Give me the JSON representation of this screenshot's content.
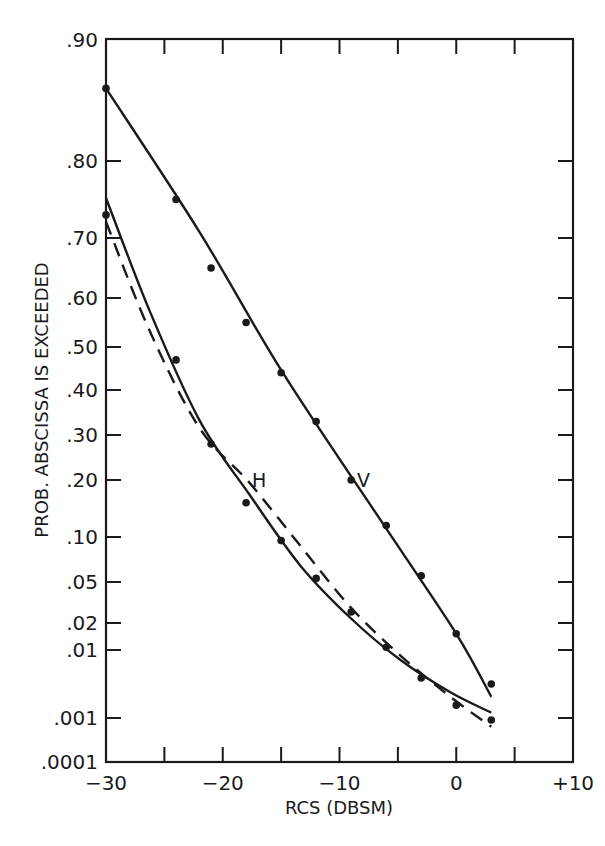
{
  "chart_data": {
    "type": "line",
    "title": "",
    "xlabel": "RCS (DBSM)",
    "ylabel": "PROB. ABSCISSA IS EXCEEDED",
    "xlim": [
      -30,
      10
    ],
    "x_ticks": [
      -30,
      -25,
      -20,
      -15,
      -10,
      -5,
      0,
      5,
      10
    ],
    "x_tick_labels": [
      {
        "value": -30,
        "label": "−30"
      },
      {
        "value": -20,
        "label": "−20"
      },
      {
        "value": -10,
        "label": "−10"
      },
      {
        "value": 0,
        "label": "0"
      },
      {
        "value": 10,
        "label": "+10"
      }
    ],
    "y_scale": "probability",
    "ylim": [
      0.0001,
      0.9
    ],
    "y_ticks": [
      {
        "value": 0.9,
        "label": ".90"
      },
      {
        "value": 0.8,
        "label": ".80"
      },
      {
        "value": 0.7,
        "label": ".70"
      },
      {
        "value": 0.6,
        "label": ".60"
      },
      {
        "value": 0.5,
        "label": ".50"
      },
      {
        "value": 0.4,
        "label": ".40"
      },
      {
        "value": 0.3,
        "label": ".30"
      },
      {
        "value": 0.2,
        "label": ".20"
      },
      {
        "value": 0.1,
        "label": ".10"
      },
      {
        "value": 0.05,
        "label": ".05"
      },
      {
        "value": 0.02,
        "label": ".02"
      },
      {
        "value": 0.01,
        "label": ".01"
      },
      {
        "value": 0.001,
        "label": ".001"
      },
      {
        "value": 0.0001,
        "label": ".0001"
      }
    ],
    "grid": false,
    "legend": "none",
    "series": [
      {
        "name": "V",
        "label": "V",
        "label_at": {
          "x": -8.5,
          "y": 0.2
        },
        "points": {
          "x": [
            -30,
            -24,
            -21,
            -18,
            -15,
            -12,
            -9,
            -6,
            -3,
            0,
            3
          ],
          "y": [
            0.86,
            0.75,
            0.65,
            0.55,
            0.44,
            0.33,
            0.2,
            0.12,
            0.057,
            0.016,
            0.0055
          ]
        },
        "fit": {
          "style": "solid",
          "x": [
            -30,
            -22,
            -14.9,
            -6.1,
            0,
            3
          ],
          "y": [
            0.86,
            0.708,
            0.442,
            0.118,
            0.016,
            0.0038
          ]
        }
      },
      {
        "name": "H",
        "label": "H",
        "label_at": {
          "x": -17.5,
          "y": 0.2
        },
        "points": {
          "x": [
            -30,
            -24,
            -21,
            -18,
            -15,
            -12,
            -9,
            -6,
            -3,
            0,
            3
          ],
          "y": [
            0.73,
            0.47,
            0.28,
            0.16,
            0.096,
            0.054,
            0.028,
            0.011,
            0.0063,
            0.0027,
            0.00096
          ]
        },
        "fit": {
          "style": "solid",
          "x": [
            -30,
            -26.3,
            -22,
            -17.7,
            -13.4,
            -9.1,
            -4.8,
            -0.5,
            3
          ],
          "y": [
            0.752,
            0.576,
            0.333,
            0.174,
            0.069,
            0.024,
            0.0087,
            0.0044,
            0.0017
          ]
        }
      },
      {
        "name": "H-dashed-fit",
        "label": "",
        "fit": {
          "style": "dashed",
          "x": [
            -30,
            -26.3,
            -22,
            -17.7,
            -13.4,
            -9.1,
            -4.8,
            -0.5,
            3
          ],
          "y": [
            0.721,
            0.535,
            0.316,
            0.195,
            0.091,
            0.032,
            0.0093,
            0.0038,
            0.00082
          ]
        }
      }
    ]
  }
}
